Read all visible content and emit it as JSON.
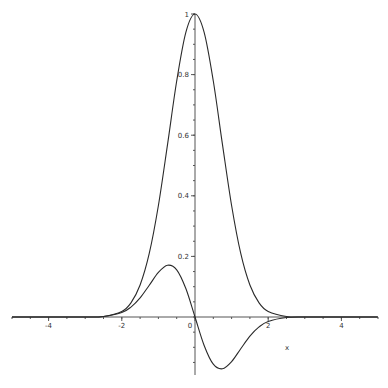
{
  "chart_data": {
    "type": "line",
    "title": "",
    "xlabel": "x",
    "ylabel": "",
    "xlim": [
      -5,
      5
    ],
    "ylim": [
      -0.19,
      1.0
    ],
    "grid": false,
    "legend": null,
    "x_ticks": [
      {
        "value": -4,
        "label": "-4"
      },
      {
        "value": -2,
        "label": "-2"
      },
      {
        "value": 0,
        "label": "0"
      },
      {
        "value": 2,
        "label": "2"
      },
      {
        "value": 4,
        "label": "4"
      }
    ],
    "y_ticks": [
      {
        "value": 0.2,
        "label": "0.2"
      },
      {
        "value": 0.4,
        "label": "0.4"
      },
      {
        "value": 0.6,
        "label": "0.6"
      },
      {
        "value": 0.8,
        "label": "0.8"
      },
      {
        "value": 1.0,
        "label": "1"
      }
    ],
    "x": [
      -5,
      -4,
      -3,
      -2.5,
      -2,
      -1.75,
      -1.5,
      -1.25,
      -1,
      -0.75,
      -0.5,
      -0.25,
      0,
      0.25,
      0.5,
      0.75,
      1,
      1.25,
      1.5,
      1.75,
      2,
      2.5,
      3,
      4,
      5
    ],
    "series": [
      {
        "name": "gaussian",
        "color": "#2a2a2a",
        "values": [
          0.0,
          0.0,
          0.0001,
          0.0019,
          0.0183,
          0.0468,
          0.1054,
          0.2096,
          0.3679,
          0.5698,
          0.7788,
          0.9394,
          1.0,
          0.9394,
          0.7788,
          0.5698,
          0.3679,
          0.2096,
          0.1054,
          0.0468,
          0.0183,
          0.0019,
          0.0001,
          0.0,
          0.0
        ]
      },
      {
        "name": "derivative-shaped",
        "color": "#2a2a2a",
        "values": [
          0.0,
          0.0,
          0.0001,
          0.0019,
          0.0147,
          0.0328,
          0.0632,
          0.1048,
          0.1472,
          0.1709,
          0.1558,
          0.0939,
          0.0,
          -0.0939,
          -0.1558,
          -0.1709,
          -0.1472,
          -0.1048,
          -0.0632,
          -0.0328,
          -0.0147,
          -0.0019,
          -0.0001,
          0.0,
          0.0
        ]
      }
    ]
  },
  "plot": {
    "origin_px": [
      195,
      317
    ],
    "px_per_x_unit": 36.6,
    "px_per_y_unit": 303,
    "x_axis_px": [
      12,
      377
    ],
    "y_axis_px": [
      14,
      375
    ],
    "xlabel_pos": [
      285,
      350
    ]
  }
}
